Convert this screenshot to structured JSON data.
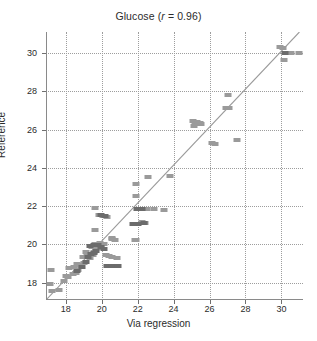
{
  "chart_data": {
    "type": "scatter",
    "title": "Glucose (r = 0.96)",
    "title_prefix": "Glucose (",
    "title_italic": "r",
    "title_suffix": " = 0.96)",
    "xlabel": "Via regression",
    "ylabel": "Reference",
    "xlim": [
      16.9,
      31.2
    ],
    "ylim": [
      17.1,
      31.1
    ],
    "xticks": [
      18,
      20,
      22,
      24,
      26,
      28,
      30
    ],
    "xticklabels": [
      "18",
      "20",
      "22",
      "24",
      "26",
      "28",
      "30"
    ],
    "yticks": [
      18,
      20,
      22,
      24,
      26,
      28,
      30
    ],
    "yticklabels": [
      "18",
      "20",
      "22",
      "24",
      "26",
      "28",
      "30"
    ],
    "grid": true,
    "grid_style": "dotted",
    "legend": null,
    "correlation": 0.96,
    "marker_shape": "square",
    "marker_colors": {
      "light": "#9a9a9a",
      "dark": "#6b6b6b"
    },
    "fit_line": {
      "type": "identity",
      "color": "#9a9a9a",
      "x1": 16.9,
      "y1": 17.1,
      "x2": 31.0,
      "y2": 31.1
    },
    "series": [
      {
        "name": "light",
        "color": "#9a9a9a",
        "points": [
          [
            17.1,
            17.95
          ],
          [
            17.25,
            17.55
          ],
          [
            17.6,
            17.6
          ],
          [
            17.2,
            18.65
          ],
          [
            17.9,
            18.1
          ],
          [
            18.0,
            18.35
          ],
          [
            18.15,
            18.3
          ],
          [
            18.4,
            18.45
          ],
          [
            18.55,
            18.5
          ],
          [
            18.2,
            18.75
          ],
          [
            18.45,
            18.8
          ],
          [
            18.7,
            18.65
          ],
          [
            18.85,
            18.9
          ],
          [
            18.6,
            19.0
          ],
          [
            19.0,
            19.05
          ],
          [
            18.95,
            19.35
          ],
          [
            19.2,
            19.4
          ],
          [
            19.35,
            19.3
          ],
          [
            19.5,
            19.45
          ],
          [
            19.15,
            19.6
          ],
          [
            19.55,
            19.6
          ],
          [
            19.7,
            19.75
          ],
          [
            19.45,
            19.85
          ],
          [
            19.85,
            19.8
          ],
          [
            19.6,
            20.0
          ],
          [
            19.95,
            19.95
          ],
          [
            20.1,
            20.0
          ],
          [
            19.9,
            20.1
          ],
          [
            20.25,
            19.45
          ],
          [
            20.4,
            19.4
          ],
          [
            20.6,
            19.35
          ],
          [
            20.85,
            19.3
          ],
          [
            19.6,
            20.75
          ],
          [
            19.6,
            21.9
          ],
          [
            19.85,
            21.55
          ],
          [
            20.05,
            21.5
          ],
          [
            20.3,
            21.45
          ],
          [
            20.6,
            20.35
          ],
          [
            20.55,
            20.3
          ],
          [
            21.9,
            20.25
          ],
          [
            21.85,
            20.25
          ],
          [
            20.75,
            20.25
          ],
          [
            21.9,
            22.55
          ],
          [
            21.9,
            23.15
          ],
          [
            22.25,
            21.15
          ],
          [
            22.4,
            21.1
          ],
          [
            22.6,
            23.55
          ],
          [
            23.8,
            23.6
          ],
          [
            22.5,
            21.85
          ],
          [
            22.9,
            21.85
          ],
          [
            23.45,
            21.8
          ],
          [
            25.1,
            26.45
          ],
          [
            25.3,
            26.4
          ],
          [
            25.45,
            26.35
          ],
          [
            25.2,
            26.3
          ],
          [
            25.5,
            26.3
          ],
          [
            25.15,
            26.2
          ],
          [
            26.15,
            25.3
          ],
          [
            26.3,
            25.25
          ],
          [
            26.9,
            27.15
          ],
          [
            27.1,
            27.15
          ],
          [
            27.55,
            25.45
          ],
          [
            27.05,
            27.8
          ],
          [
            29.9,
            30.3
          ],
          [
            30.1,
            30.25
          ],
          [
            30.25,
            30.0
          ],
          [
            30.55,
            30.0
          ],
          [
            30.95,
            30.0
          ],
          [
            30.15,
            29.65
          ]
        ]
      },
      {
        "name": "dark",
        "color": "#6b6b6b",
        "points": [
          [
            18.6,
            18.6
          ],
          [
            18.9,
            18.85
          ],
          [
            19.1,
            19.1
          ],
          [
            19.25,
            19.35
          ],
          [
            19.4,
            19.5
          ],
          [
            19.55,
            19.55
          ],
          [
            19.7,
            19.65
          ],
          [
            19.35,
            19.9
          ],
          [
            19.55,
            19.95
          ],
          [
            19.8,
            19.95
          ],
          [
            19.95,
            19.85
          ],
          [
            20.15,
            19.75
          ],
          [
            20.3,
            18.9
          ],
          [
            20.6,
            18.9
          ],
          [
            20.9,
            18.9
          ],
          [
            19.95,
            21.55
          ],
          [
            20.2,
            21.5
          ],
          [
            21.95,
            21.85
          ],
          [
            22.25,
            21.85
          ],
          [
            22.35,
            21.1
          ],
          [
            22.0,
            21.05
          ],
          [
            21.75,
            21.05
          ],
          [
            30.2,
            30.0
          ]
        ]
      }
    ]
  }
}
